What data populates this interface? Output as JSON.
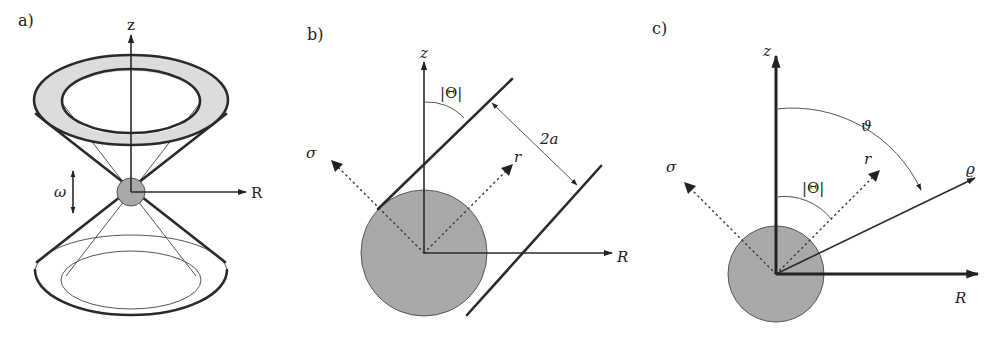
{
  "figure": {
    "panels": [
      {
        "id": "a",
        "label": "a)",
        "axes": {
          "vertical": "z",
          "horizontal": "R"
        },
        "annotations": {
          "oscillation": "ω"
        },
        "description": "Double cone (hourglass) with shaded torus ring on top, small sphere at apex oscillating vertically"
      },
      {
        "id": "b",
        "label": "b)",
        "axes": {
          "vertical": "z",
          "horizontal": "R",
          "diag_left": "σ",
          "diag_right": "r"
        },
        "annotations": {
          "angle": "|Θ|",
          "width": "2a"
        },
        "description": "Sphere with two parallel walls tilted by angle |Θ|, separated by distance 2a"
      },
      {
        "id": "c",
        "label": "c)",
        "axes": {
          "vertical": "z",
          "horizontal": "R",
          "diag_left": "σ",
          "diag_right": "r",
          "radial": "ϱ"
        },
        "annotations": {
          "angle_theta": "|Θ|",
          "angle_vartheta": "ϑ"
        },
        "description": "Sphere at origin with polar coordinate ϱ and angle ϑ measured from z"
      }
    ]
  }
}
